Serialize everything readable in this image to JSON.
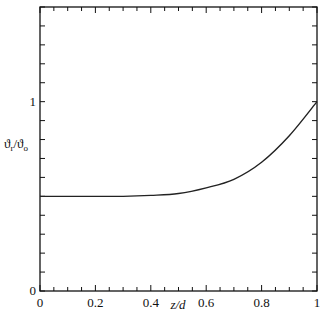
{
  "chart_data": {
    "type": "line",
    "title": "",
    "xlabel": "z/d",
    "ylabel": "ϑr/ϑo",
    "ylabel_main": "ϑ",
    "ylabel_sub_num": "r",
    "ylabel_sub_den": "o",
    "xlim": [
      0,
      1
    ],
    "ylim": [
      0,
      1.5
    ],
    "grid": false,
    "legend": null,
    "x_tick_labels": [
      "0",
      "0.2",
      "0.4",
      "0.6",
      "0.8",
      "1"
    ],
    "x_tick_values": [
      0,
      0.2,
      0.4,
      0.6,
      0.8,
      1
    ],
    "x_minor_step": 0.05,
    "y_tick_labels": [
      "0",
      "1"
    ],
    "y_tick_values": [
      0,
      1
    ],
    "y_minor_step": 0.1,
    "series": [
      {
        "name": "ϑr/ϑo",
        "x": [
          0,
          0.1,
          0.2,
          0.3,
          0.4,
          0.5,
          0.6,
          0.7,
          0.8,
          0.9,
          1.0
        ],
        "values": [
          0.5,
          0.5,
          0.5,
          0.5,
          0.505,
          0.515,
          0.545,
          0.59,
          0.68,
          0.82,
          1.0
        ]
      }
    ]
  }
}
